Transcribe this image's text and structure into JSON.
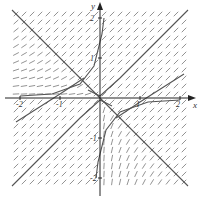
{
  "chart_data": {
    "type": "scatter",
    "subtype": "slope-field",
    "title": "",
    "xlabel": "x",
    "ylabel": "y",
    "xlim": [
      -2.4,
      2.4
    ],
    "ylim": [
      -2.4,
      2.4
    ],
    "x_ticks": [
      -2,
      -1,
      1,
      2
    ],
    "y_ticks": [
      -2,
      -1,
      1,
      2
    ],
    "x_tick_labels": [
      "-2",
      "-1",
      "1",
      "2"
    ],
    "y_tick_labels": [
      "-2",
      "-1",
      "1",
      "2"
    ],
    "grid": false,
    "legend": null,
    "field_grid_step": 0.2,
    "field_extent": [
      -2.1,
      2.1
    ],
    "solution_curves": [
      {
        "name": "y = -x",
        "points": [
          [
            -2.2,
            2.2
          ],
          [
            2.2,
            -2.2
          ]
        ]
      },
      {
        "name": "upper-right curve",
        "points": [
          [
            -0.3,
            0.2
          ],
          [
            0,
            0.05
          ],
          [
            0.5,
            0.5
          ],
          [
            1.2,
            1.2
          ],
          [
            2.2,
            2.2
          ]
        ]
      },
      {
        "name": "lower-left curve",
        "points": [
          [
            0.3,
            -0.2
          ],
          [
            0,
            -0.05
          ],
          [
            -0.5,
            -0.5
          ],
          [
            -1.2,
            -1.2
          ],
          [
            -2.2,
            -2.2
          ]
        ]
      },
      {
        "name": "upper-left curve",
        "points": [
          [
            -2.0,
            0.05
          ],
          [
            -1.2,
            0.1
          ],
          [
            -0.5,
            0.35
          ],
          [
            -0.15,
            0.8
          ],
          [
            0.05,
            1.6
          ],
          [
            0.1,
            2.0
          ]
        ]
      },
      {
        "name": "lower-right curve",
        "points": [
          [
            2.0,
            -0.05
          ],
          [
            1.2,
            -0.1
          ],
          [
            0.5,
            -0.35
          ],
          [
            0.15,
            -0.8
          ],
          [
            -0.05,
            -1.6
          ],
          [
            -0.1,
            -2.0
          ]
        ]
      },
      {
        "name": "bottom-left long",
        "points": [
          [
            -2.1,
            -0.6
          ],
          [
            -1.0,
            0.1
          ],
          [
            -0.4,
            0.5
          ]
        ]
      },
      {
        "name": "top-right long",
        "points": [
          [
            2.1,
            0.6
          ],
          [
            1.0,
            -0.1
          ],
          [
            0.4,
            -0.5
          ]
        ]
      }
    ]
  },
  "colors": {
    "axis": "#222222",
    "field": "#777777",
    "curve": "#555555"
  }
}
